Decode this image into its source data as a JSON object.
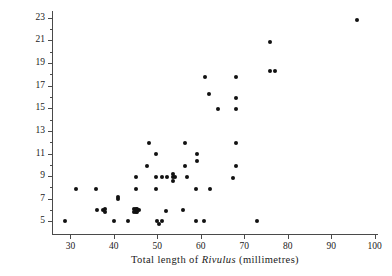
{
  "chart_data": {
    "type": "scatter",
    "title": "",
    "xlabel": "Total length of Rivulus (millimetres)",
    "xlabel_parts": [
      {
        "text": "Total  length  of  ",
        "italic": false
      },
      {
        "text": "Rivulus",
        "italic": true
      },
      {
        "text": "  (millimetres)",
        "italic": false
      }
    ],
    "ylabel": "Total length of guppy (millimetres)",
    "xlim": [
      26,
      101
    ],
    "ylim": [
      3.8,
      23.6
    ],
    "xticks": [
      30,
      40,
      50,
      60,
      70,
      80,
      90,
      100
    ],
    "yticks": [
      5,
      7,
      9,
      11,
      13,
      15,
      17,
      19,
      21,
      23
    ],
    "yticks_minor": [
      6,
      8,
      10,
      12,
      14,
      16,
      18,
      20,
      22
    ],
    "grid": false,
    "legend": null,
    "marker": "filled-circle",
    "marker_color": "#111111",
    "points": [
      [
        28.8,
        5.0
      ],
      [
        31.2,
        7.9
      ],
      [
        35.9,
        7.9
      ],
      [
        36.2,
        6.0
      ],
      [
        37.6,
        6.0
      ],
      [
        37.9,
        5.8
      ],
      [
        37.9,
        6.1
      ],
      [
        40.0,
        5.0
      ],
      [
        41.0,
        7.0
      ],
      [
        41.0,
        7.2
      ],
      [
        43.2,
        5.0
      ],
      [
        45.0,
        8.9
      ],
      [
        45.0,
        7.9
      ],
      [
        44.6,
        6.1
      ],
      [
        45.0,
        6.1
      ],
      [
        45.4,
        6.1
      ],
      [
        45.0,
        5.8
      ],
      [
        44.6,
        5.8
      ],
      [
        45.4,
        5.8
      ],
      [
        45.8,
        6.0
      ],
      [
        47.6,
        9.9
      ],
      [
        48.0,
        11.9
      ],
      [
        49.6,
        8.9
      ],
      [
        49.6,
        11.0
      ],
      [
        49.8,
        7.9
      ],
      [
        50.0,
        5.0
      ],
      [
        50.3,
        4.8
      ],
      [
        51.0,
        5.0
      ],
      [
        51.0,
        8.9
      ],
      [
        52.0,
        5.9
      ],
      [
        52.3,
        8.9
      ],
      [
        53.6,
        9.2
      ],
      [
        53.6,
        8.9
      ],
      [
        53.6,
        8.6
      ],
      [
        54.0,
        8.9
      ],
      [
        55.8,
        6.0
      ],
      [
        56.4,
        11.9
      ],
      [
        56.4,
        9.9
      ],
      [
        56.9,
        8.9
      ],
      [
        58.8,
        5.0
      ],
      [
        59.0,
        7.9
      ],
      [
        59.2,
        11.0
      ],
      [
        59.2,
        10.3
      ],
      [
        60.8,
        5.0
      ],
      [
        61.0,
        17.8
      ],
      [
        62.0,
        16.3
      ],
      [
        62.2,
        7.9
      ],
      [
        64.0,
        14.9
      ],
      [
        67.4,
        8.8
      ],
      [
        68.0,
        17.8
      ],
      [
        68.0,
        15.9
      ],
      [
        68.0,
        14.9
      ],
      [
        68.0,
        11.9
      ],
      [
        68.0,
        9.9
      ],
      [
        73.0,
        5.0
      ],
      [
        75.9,
        20.9
      ],
      [
        75.9,
        18.3
      ],
      [
        77.1,
        18.3
      ],
      [
        95.9,
        22.8
      ]
    ]
  }
}
